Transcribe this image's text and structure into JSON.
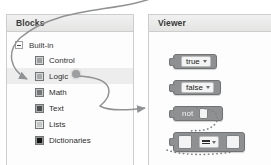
{
  "blocks_panel": {
    "header": {
      "title": "Blocks"
    },
    "tree": {
      "root": {
        "label": "Built-in",
        "expander_icon": "minus-expander-icon"
      },
      "items": [
        {
          "label": "Control",
          "swatch_color": "#9aa0a6"
        },
        {
          "label": "Logic",
          "swatch_color": "#a6abb0",
          "selected": true
        },
        {
          "label": "Math",
          "swatch_color": "#73787d"
        },
        {
          "label": "Text",
          "swatch_color": "#4a4e52"
        },
        {
          "label": "Lists",
          "swatch_color": "#c3c7ca"
        },
        {
          "label": "Dictionaries",
          "swatch_color": "#111315"
        }
      ]
    }
  },
  "viewer_panel": {
    "header": {
      "title": "Viewer"
    },
    "blocks": [
      {
        "id": "true",
        "label": "true",
        "kind": "value-dropdown",
        "dropdown_icon": "caret-down-icon"
      },
      {
        "id": "false",
        "label": "false",
        "kind": "value-dropdown",
        "dropdown_icon": "caret-down-icon"
      },
      {
        "id": "not",
        "label": "not",
        "kind": "unary-operator",
        "socket_count": 1
      },
      {
        "id": "compare",
        "label": "=",
        "kind": "comparison-operator",
        "dropdown_icon": "caret-down-icon",
        "socket_count": 2
      }
    ]
  },
  "annotations": {
    "arrow_to_logic": "curved-arrow-icon",
    "arrow_to_not_block": "curved-arrow-icon",
    "drag_origin_dot": "drag-handle-dot",
    "dotted_connector": "dotted-path"
  },
  "colors": {
    "panel_border": "#c9cdd1",
    "header_gradient_top": "#f1f1f0",
    "header_gradient_bottom": "#e4e4e2",
    "block_fill": "#8b9097",
    "block_stroke": "#6d7278",
    "selection_row": "#ededec",
    "arrow_stroke": "#8e9296"
  }
}
